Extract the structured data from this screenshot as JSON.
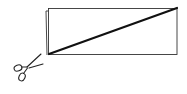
{
  "diagram": {
    "elements": [
      {
        "type": "sheet-back-edge",
        "description": "offset left edge of underlying sheet"
      },
      {
        "type": "rectangle",
        "description": "paper sheet outline"
      },
      {
        "type": "diagonal-cut-line",
        "description": "bold diagonal from bottom-left to top-right"
      },
      {
        "type": "scissors-icon",
        "description": "scissors at bottom-left corner pointing toward the cut line"
      }
    ],
    "colors": {
      "stroke": "#1a1a1a",
      "cut_line": "#111111",
      "background": "#ffffff"
    }
  }
}
